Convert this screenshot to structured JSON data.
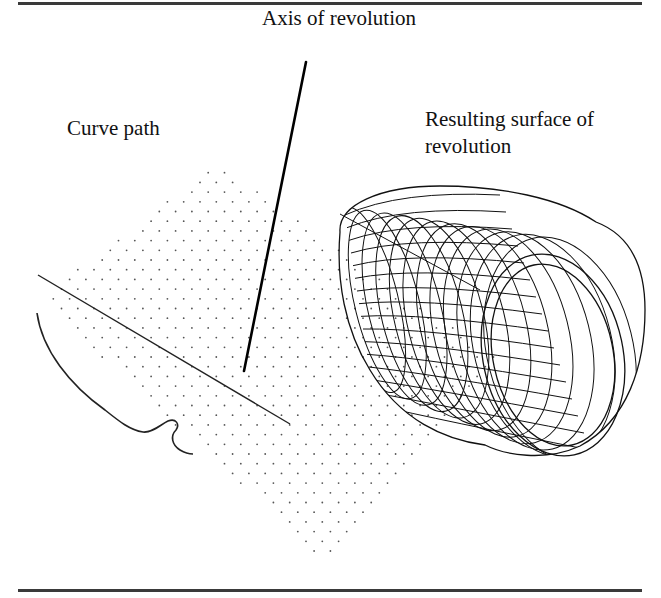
{
  "figure": {
    "labels": {
      "axis": "Axis of revolution",
      "curve": "Curve path",
      "surface": "Resulting surface of revolution"
    },
    "colors": {
      "ink": "#111111",
      "rule": "#3a3a3a",
      "grid_dot": "#555555",
      "background": "#ffffff"
    },
    "elements": {
      "axis_line": {
        "x1": 306,
        "y1": 62,
        "x2": 244,
        "y2": 371
      },
      "profile_line": {
        "x1": 38,
        "y1": 275,
        "x2": 290,
        "y2": 424
      },
      "grid": {
        "shape": "diamond",
        "dx": 16.3,
        "dy": 9.7
      }
    }
  }
}
